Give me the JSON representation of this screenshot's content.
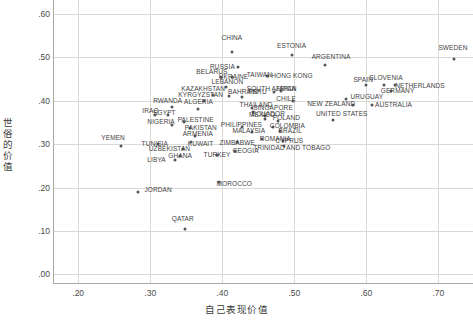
{
  "chart_data": {
    "type": "scatter",
    "title": "",
    "xlabel": "自己表现价值",
    "ylabel": "世俗的价值",
    "xlim": [
      0.165,
      0.748
    ],
    "ylim": [
      -0.02,
      0.632
    ],
    "xticks": [
      ".20",
      ".30",
      ".40",
      ".50",
      ".60",
      ".70"
    ],
    "xtick_values": [
      0.2,
      0.3,
      0.4,
      0.5,
      0.6,
      0.7
    ],
    "yticks": [
      ".00",
      ".10",
      ".20",
      ".30",
      ".40",
      ".50",
      ".60"
    ],
    "ytick_values": [
      0.0,
      0.1,
      0.2,
      0.3,
      0.4,
      0.5,
      0.6
    ],
    "grid": true,
    "legend": "none",
    "marker_color": "#55565a",
    "grid_color": "#d9d9d6",
    "axis_color": "#a8a8a4",
    "points": [
      {
        "label": "CHINA",
        "x": 0.413,
        "y": 0.512,
        "lx": 0.399,
        "ly": 0.545
      },
      {
        "label": "ESTONIA",
        "x": 0.497,
        "y": 0.505,
        "lx": 0.476,
        "ly": 0.527
      },
      {
        "label": "SWEDEN",
        "x": 0.722,
        "y": 0.497,
        "lx": 0.7,
        "ly": 0.522
      },
      {
        "label": "ARGENTINA",
        "x": 0.543,
        "y": 0.482,
        "lx": 0.524,
        "ly": 0.5
      },
      {
        "label": "RUSSIA",
        "x": 0.422,
        "y": 0.477,
        "lx": 0.383,
        "ly": 0.478
      },
      {
        "label": "TAIWAN",
        "x": 0.462,
        "y": 0.458,
        "lx": 0.434,
        "ly": 0.46
      },
      {
        "label": "HONG KONG",
        "x": 0.464,
        "y": 0.458,
        "lx": 0.468,
        "ly": 0.458
      },
      {
        "label": "UKRAINE",
        "x": 0.414,
        "y": 0.455,
        "lx": 0.395,
        "ly": 0.455
      },
      {
        "label": "BELARUS",
        "x": 0.398,
        "y": 0.455,
        "lx": 0.364,
        "ly": 0.465
      },
      {
        "label": "SLOVENIA",
        "x": 0.625,
        "y": 0.437,
        "lx": 0.604,
        "ly": 0.452
      },
      {
        "label": "SPAIN",
        "x": 0.6,
        "y": 0.436,
        "lx": 0.582,
        "ly": 0.448
      },
      {
        "label": "NETHERLANDS",
        "x": 0.64,
        "y": 0.436,
        "lx": 0.64,
        "ly": 0.434
      },
      {
        "label": "LEBANON",
        "x": 0.405,
        "y": 0.432,
        "lx": 0.385,
        "ly": 0.444
      },
      {
        "label": "GERMANY",
        "x": 0.634,
        "y": 0.422,
        "lx": 0.62,
        "ly": 0.422
      },
      {
        "label": "JAPAN",
        "x": 0.482,
        "y": 0.422,
        "lx": 0.474,
        "ly": 0.427
      },
      {
        "label": "SOUTH AFRICA",
        "x": 0.472,
        "y": 0.421,
        "lx": 0.434,
        "ly": 0.427
      },
      {
        "label": "KAZAKHSTAN",
        "x": 0.387,
        "y": 0.414,
        "lx": 0.343,
        "ly": 0.427
      },
      {
        "label": "BAHRAIN",
        "x": 0.409,
        "y": 0.41,
        "lx": 0.408,
        "ly": 0.42
      },
      {
        "label": "PERU",
        "x": 0.428,
        "y": 0.408,
        "lx": 0.436,
        "ly": 0.42
      },
      {
        "label": "KYRGYZSTAN",
        "x": 0.374,
        "y": 0.4,
        "lx": 0.339,
        "ly": 0.414
      },
      {
        "label": "URUGUAY",
        "x": 0.572,
        "y": 0.403,
        "lx": 0.578,
        "ly": 0.408
      },
      {
        "label": "CHILE",
        "x": 0.498,
        "y": 0.4,
        "lx": 0.475,
        "ly": 0.404
      },
      {
        "label": "AUSTRALIA",
        "x": 0.608,
        "y": 0.389,
        "lx": 0.612,
        "ly": 0.389
      },
      {
        "label": "NEW ZEALAND",
        "x": 0.582,
        "y": 0.391,
        "lx": 0.518,
        "ly": 0.392
      },
      {
        "label": "RWANDA",
        "x": 0.33,
        "y": 0.385,
        "lx": 0.304,
        "ly": 0.4
      },
      {
        "label": "ALGERIA",
        "x": 0.366,
        "y": 0.38,
        "lx": 0.347,
        "ly": 0.396
      },
      {
        "label": "SINGAPORE",
        "x": 0.441,
        "y": 0.383,
        "lx": 0.443,
        "ly": 0.383
      },
      {
        "label": "THAILAND",
        "x": 0.442,
        "y": 0.374,
        "lx": 0.424,
        "ly": 0.39
      },
      {
        "label": "EGYPT",
        "x": 0.325,
        "y": 0.367,
        "lx": 0.304,
        "ly": 0.372
      },
      {
        "label": "IRAQ",
        "x": 0.306,
        "y": 0.367,
        "lx": 0.289,
        "ly": 0.377
      },
      {
        "label": "MEXICO",
        "x": 0.459,
        "y": 0.365,
        "lx": 0.437,
        "ly": 0.368
      },
      {
        "label": "ECUADOR",
        "x": 0.459,
        "y": 0.357,
        "lx": 0.441,
        "ly": 0.37
      },
      {
        "label": "UNITED STATES",
        "x": 0.554,
        "y": 0.356,
        "lx": 0.53,
        "ly": 0.37
      },
      {
        "label": "POLAND",
        "x": 0.478,
        "y": 0.353,
        "lx": 0.47,
        "ly": 0.36
      },
      {
        "label": "PALESTINE",
        "x": 0.347,
        "y": 0.351,
        "lx": 0.338,
        "ly": 0.356
      },
      {
        "label": "NIGERIA",
        "x": 0.33,
        "y": 0.345,
        "lx": 0.296,
        "ly": 0.352
      },
      {
        "label": "COLOMBIA",
        "x": 0.47,
        "y": 0.34,
        "lx": 0.466,
        "ly": 0.341
      },
      {
        "label": "PHILIPPINES",
        "x": 0.428,
        "y": 0.34,
        "lx": 0.398,
        "ly": 0.345
      },
      {
        "label": "PAKISTAN",
        "x": 0.355,
        "y": 0.337,
        "lx": 0.348,
        "ly": 0.338
      },
      {
        "label": "BRAZIL",
        "x": 0.48,
        "y": 0.331,
        "lx": 0.478,
        "ly": 0.33
      },
      {
        "label": "MALAYSIA",
        "x": 0.441,
        "y": 0.328,
        "lx": 0.414,
        "ly": 0.33
      },
      {
        "label": "YEMEN",
        "x": 0.259,
        "y": 0.295,
        "lx": 0.232,
        "ly": 0.315
      },
      {
        "label": "ARMENIA",
        "x": 0.362,
        "y": 0.319,
        "lx": 0.345,
        "ly": 0.324
      },
      {
        "label": "ROMANIA",
        "x": 0.455,
        "y": 0.312,
        "lx": 0.452,
        "ly": 0.312
      },
      {
        "label": "CYPRUS",
        "x": 0.484,
        "y": 0.308,
        "lx": 0.474,
        "ly": 0.308
      },
      {
        "label": "KUWAIT",
        "x": 0.356,
        "y": 0.306,
        "lx": 0.352,
        "ly": 0.3
      },
      {
        "label": "ZIMBABWE",
        "x": 0.42,
        "y": 0.306,
        "lx": 0.396,
        "ly": 0.302
      },
      {
        "label": "TUNISIA",
        "x": 0.311,
        "y": 0.3,
        "lx": 0.288,
        "ly": 0.3
      },
      {
        "label": "TRINIDAD AND TOBAGO",
        "x": 0.485,
        "y": 0.295,
        "lx": 0.443,
        "ly": 0.292
      },
      {
        "label": "UZBEKISTAN",
        "x": 0.345,
        "y": 0.288,
        "lx": 0.298,
        "ly": 0.288
      },
      {
        "label": "GEOGIA",
        "x": 0.417,
        "y": 0.283,
        "lx": 0.414,
        "ly": 0.283
      },
      {
        "label": "TURKEY",
        "x": 0.393,
        "y": 0.275,
        "lx": 0.374,
        "ly": 0.275
      },
      {
        "label": "GHANA",
        "x": 0.341,
        "y": 0.272,
        "lx": 0.325,
        "ly": 0.272
      },
      {
        "label": "LIBYA",
        "x": 0.335,
        "y": 0.263,
        "lx": 0.296,
        "ly": 0.263
      },
      {
        "label": "MOROCCO",
        "x": 0.396,
        "y": 0.213,
        "lx": 0.392,
        "ly": 0.208
      },
      {
        "label": "JORDAN",
        "x": 0.283,
        "y": 0.19,
        "lx": 0.292,
        "ly": 0.195
      },
      {
        "label": "QATAR",
        "x": 0.348,
        "y": 0.104,
        "lx": 0.33,
        "ly": 0.128
      }
    ]
  }
}
